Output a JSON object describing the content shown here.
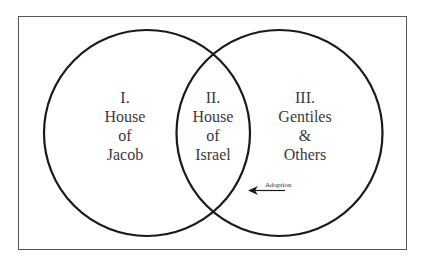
{
  "diagram": {
    "type": "venn",
    "sets": [
      {
        "id": "left",
        "lines": [
          "I.",
          "House",
          "of",
          "Jacob"
        ]
      },
      {
        "id": "intersection",
        "lines": [
          "II.",
          "House",
          "of",
          "Israel"
        ]
      },
      {
        "id": "right",
        "lines": [
          "III.",
          "Gentiles",
          "&",
          "Others"
        ]
      }
    ],
    "annotation": {
      "label": "Adoption",
      "direction": "left"
    },
    "colors": {
      "stroke": "#1a1a1a",
      "frame": "#555555",
      "text": "#3a3a3a",
      "background": "#ffffff"
    }
  }
}
